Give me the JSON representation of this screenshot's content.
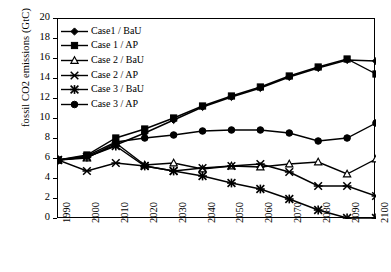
{
  "chart_data": {
    "type": "line",
    "title": "",
    "xlabel": "",
    "ylabel": "fossil CO2 emissions (GtC)",
    "x": [
      1990,
      2000,
      2010,
      2020,
      2030,
      2040,
      2050,
      2060,
      2070,
      2080,
      2090,
      2100
    ],
    "xlim": [
      1990,
      2100
    ],
    "ylim": [
      0,
      20
    ],
    "ytick_step": 2,
    "grid": false,
    "legend_position": "top-left inside",
    "xticklabels": [
      "1990",
      "2000",
      "2010",
      "2020",
      "2030",
      "2040",
      "2050",
      "2060",
      "2070",
      "2080",
      "2090",
      "2100"
    ],
    "yticklabels": [
      "0",
      "2",
      "4",
      "6",
      "8",
      "10",
      "12",
      "14",
      "16",
      "18",
      "20"
    ],
    "series": [
      {
        "name": "Case1 /  BaU",
        "marker": "diamond-filled",
        "values": [
          5.9,
          6.2,
          7.4,
          8.6,
          9.9,
          11.2,
          12.2,
          13.1,
          14.2,
          15.1,
          15.9,
          15.8
        ]
      },
      {
        "name": "Case 1 /  AP",
        "marker": "square-filled",
        "values": [
          5.9,
          6.4,
          8.1,
          9.0,
          10.1,
          11.3,
          12.3,
          13.2,
          14.3,
          15.2,
          16.0,
          14.5
        ]
      },
      {
        "name": "Case 2 /  BaU",
        "marker": "triangle-open",
        "values": [
          5.9,
          6.1,
          7.6,
          5.4,
          5.6,
          5.0,
          5.3,
          5.2,
          5.5,
          5.7,
          4.5,
          6.0
        ]
      },
      {
        "name": "Case 2 /  AP",
        "marker": "x-cross",
        "values": [
          5.9,
          4.8,
          5.6,
          5.3,
          4.8,
          5.1,
          5.3,
          5.5,
          4.7,
          3.3,
          3.3,
          2.3
        ]
      },
      {
        "name": "Case 3 /  BaU",
        "marker": "star",
        "values": [
          5.9,
          6.2,
          7.3,
          5.3,
          4.8,
          4.3,
          3.6,
          3.0,
          2.0,
          0.9,
          0.1,
          0.1
        ]
      },
      {
        "name": "Case 3 /  AP",
        "marker": "circle-filled",
        "values": [
          5.9,
          6.3,
          7.7,
          8.1,
          8.4,
          8.8,
          8.9,
          8.9,
          8.6,
          7.8,
          8.1,
          9.6
        ]
      }
    ],
    "colors": {
      "lines": "#000000",
      "axes": "#000000",
      "background": "#FFFFFF"
    }
  }
}
